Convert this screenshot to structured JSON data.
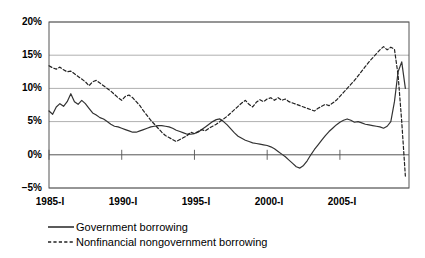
{
  "chart_data": {
    "type": "line",
    "title": "",
    "subtitle": "",
    "xlabel": "",
    "ylabel": "",
    "grid": true,
    "legend_position": "bottom-left",
    "ylim": [
      -5,
      20
    ],
    "yticks": [
      -5,
      0,
      5,
      10,
      15,
      20
    ],
    "ytick_labels": [
      "−5%",
      "0%",
      "5%",
      "10%",
      "15%",
      "20%"
    ],
    "xlim": [
      1985.0,
      2009.75
    ],
    "xticks": [
      1985,
      1990,
      1995,
      2000,
      2005
    ],
    "xtick_labels": [
      "1985-I",
      "1990-I",
      "1995-I",
      "2000-I",
      "2005-I"
    ],
    "x_unit": "quarters",
    "series": [
      {
        "name": "Government borrowing",
        "style": "solid",
        "color": "#333333",
        "x": [
          1985.0,
          1985.25,
          1985.5,
          1985.75,
          1986.0,
          1986.25,
          1986.5,
          1986.75,
          1987.0,
          1987.25,
          1987.5,
          1987.75,
          1988.0,
          1988.25,
          1988.5,
          1988.75,
          1989.0,
          1989.25,
          1989.5,
          1989.75,
          1990.0,
          1990.25,
          1990.5,
          1990.75,
          1991.0,
          1991.25,
          1991.5,
          1991.75,
          1992.0,
          1992.25,
          1992.5,
          1992.75,
          1993.0,
          1993.25,
          1993.5,
          1993.75,
          1994.0,
          1994.25,
          1994.5,
          1994.75,
          1995.0,
          1995.25,
          1995.5,
          1995.75,
          1996.0,
          1996.25,
          1996.5,
          1996.75,
          1997.0,
          1997.25,
          1997.5,
          1997.75,
          1998.0,
          1998.25,
          1998.5,
          1998.75,
          1999.0,
          1999.25,
          1999.5,
          1999.75,
          2000.0,
          2000.25,
          2000.5,
          2000.75,
          2001.0,
          2001.25,
          2001.5,
          2001.75,
          2002.0,
          2002.25,
          2002.5,
          2002.75,
          2003.0,
          2003.25,
          2003.5,
          2003.75,
          2004.0,
          2004.25,
          2004.5,
          2004.75,
          2005.0,
          2005.25,
          2005.5,
          2005.75,
          2006.0,
          2006.25,
          2006.5,
          2006.75,
          2007.0,
          2007.25,
          2007.5,
          2007.75,
          2008.0,
          2008.25,
          2008.5,
          2008.75,
          2009.0,
          2009.25,
          2009.5
        ],
        "values": [
          6.6,
          6.1,
          7.2,
          7.7,
          7.3,
          8.0,
          9.2,
          8.0,
          7.6,
          8.2,
          7.7,
          7.0,
          6.3,
          6.0,
          5.6,
          5.4,
          5.0,
          4.6,
          4.3,
          4.2,
          4.0,
          3.8,
          3.6,
          3.4,
          3.4,
          3.6,
          3.8,
          4.0,
          4.2,
          4.3,
          4.4,
          4.4,
          4.3,
          4.2,
          4.0,
          3.7,
          3.5,
          3.3,
          3.1,
          3.1,
          3.2,
          3.4,
          3.8,
          4.2,
          4.6,
          5.0,
          5.3,
          5.4,
          5.0,
          4.5,
          3.9,
          3.3,
          2.8,
          2.5,
          2.2,
          2.0,
          1.8,
          1.7,
          1.6,
          1.5,
          1.4,
          1.2,
          0.9,
          0.5,
          0.1,
          -0.3,
          -0.8,
          -1.3,
          -1.8,
          -2.0,
          -1.6,
          -0.9,
          0.0,
          0.8,
          1.5,
          2.2,
          2.9,
          3.5,
          4.0,
          4.5,
          4.9,
          5.2,
          5.4,
          5.2,
          4.9,
          5.0,
          4.8,
          4.6,
          4.5,
          4.4,
          4.3,
          4.2,
          4.0,
          4.3,
          5.0,
          8.0,
          12.5,
          14.0,
          10.0
        ]
      },
      {
        "name": "Nonfinancial nongovernment borrowing",
        "style": "dashed",
        "color": "#222222",
        "x": [
          1985.0,
          1985.25,
          1985.5,
          1985.75,
          1986.0,
          1986.25,
          1986.5,
          1986.75,
          1987.0,
          1987.25,
          1987.5,
          1987.75,
          1988.0,
          1988.25,
          1988.5,
          1988.75,
          1989.0,
          1989.25,
          1989.5,
          1989.75,
          1990.0,
          1990.25,
          1990.5,
          1990.75,
          1991.0,
          1991.25,
          1991.5,
          1991.75,
          1992.0,
          1992.25,
          1992.5,
          1992.75,
          1993.0,
          1993.25,
          1993.5,
          1993.75,
          1994.0,
          1994.25,
          1994.5,
          1994.75,
          1995.0,
          1995.25,
          1995.5,
          1995.75,
          1996.0,
          1996.25,
          1996.5,
          1996.75,
          1997.0,
          1997.25,
          1997.5,
          1997.75,
          1998.0,
          1998.25,
          1998.5,
          1998.75,
          1999.0,
          1999.25,
          1999.5,
          1999.75,
          2000.0,
          2000.25,
          2000.5,
          2000.75,
          2001.0,
          2001.25,
          2001.5,
          2001.75,
          2002.0,
          2002.25,
          2002.5,
          2002.75,
          2003.0,
          2003.25,
          2003.5,
          2003.75,
          2004.0,
          2004.25,
          2004.5,
          2004.75,
          2005.0,
          2005.25,
          2005.5,
          2005.75,
          2006.0,
          2006.25,
          2006.5,
          2006.75,
          2007.0,
          2007.25,
          2007.5,
          2007.75,
          2008.0,
          2008.25,
          2008.5,
          2008.75,
          2009.0,
          2009.25,
          2009.5
        ],
        "values": [
          13.4,
          13.1,
          12.9,
          13.2,
          12.8,
          12.5,
          12.6,
          12.2,
          11.8,
          11.4,
          11.0,
          10.4,
          11.0,
          11.2,
          10.8,
          10.4,
          10.0,
          9.6,
          9.1,
          8.6,
          8.2,
          8.8,
          9.0,
          8.6,
          8.0,
          7.4,
          6.6,
          5.9,
          5.2,
          4.6,
          4.0,
          3.4,
          2.9,
          2.6,
          2.3,
          2.0,
          2.3,
          2.6,
          2.9,
          3.4,
          3.2,
          3.5,
          3.8,
          3.6,
          4.0,
          4.3,
          4.6,
          5.0,
          5.4,
          5.8,
          6.3,
          6.8,
          7.3,
          7.8,
          8.2,
          7.6,
          7.2,
          7.9,
          8.3,
          8.0,
          8.4,
          8.6,
          8.2,
          8.6,
          8.2,
          8.4,
          8.0,
          7.8,
          7.6,
          7.4,
          7.2,
          7.0,
          6.8,
          6.6,
          7.0,
          7.3,
          7.6,
          7.4,
          7.8,
          8.2,
          8.8,
          9.4,
          10.0,
          10.6,
          11.2,
          11.9,
          12.6,
          13.3,
          14.0,
          14.6,
          15.2,
          15.8,
          16.3,
          15.8,
          16.2,
          15.9,
          12.0,
          5.0,
          -3.2
        ]
      }
    ]
  },
  "axis": {
    "ytick_labels": [
      "20%",
      "15%",
      "10%",
      "5%",
      "0%",
      "−5%"
    ],
    "xtick_labels": [
      "1985-I",
      "1990-I",
      "1995-I",
      "2000-I",
      "2005-I"
    ]
  },
  "legend": {
    "items": [
      {
        "label": "Government borrowing",
        "style": "solid"
      },
      {
        "label": "Nonfinancial nongovernment borrowing",
        "style": "dashed"
      }
    ]
  }
}
